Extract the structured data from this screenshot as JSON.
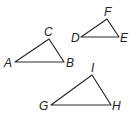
{
  "diagram": {
    "type": "geometry-triangles",
    "colors": {
      "stroke": "#2a2a2a",
      "label": "#222222",
      "background": "#ffffff"
    },
    "triangles": [
      {
        "name": "ABC",
        "vertices": [
          {
            "label": "A",
            "x": 15,
            "y": 62,
            "lx": 4,
            "ly": 67
          },
          {
            "label": "B",
            "x": 64,
            "y": 62,
            "lx": 66,
            "ly": 67
          },
          {
            "label": "C",
            "x": 49,
            "y": 39,
            "lx": 44,
            "ly": 36
          }
        ]
      },
      {
        "name": "DEF",
        "vertices": [
          {
            "label": "D",
            "x": 81,
            "y": 37,
            "lx": 71,
            "ly": 42
          },
          {
            "label": "E",
            "x": 119,
            "y": 37,
            "lx": 120,
            "ly": 42
          },
          {
            "label": "F",
            "x": 107,
            "y": 19,
            "lx": 104,
            "ly": 16
          }
        ]
      },
      {
        "name": "GHI",
        "vertices": [
          {
            "label": "G",
            "x": 51,
            "y": 105,
            "lx": 39,
            "ly": 110
          },
          {
            "label": "H",
            "x": 111,
            "y": 105,
            "lx": 112,
            "ly": 110
          },
          {
            "label": "I",
            "x": 92,
            "y": 75,
            "lx": 91,
            "ly": 72
          }
        ]
      }
    ]
  }
}
